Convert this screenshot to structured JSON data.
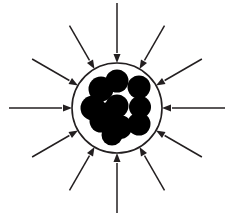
{
  "figure": {
    "title": "Inward radial compression of a particle cluster",
    "background_color": "#ffffff",
    "stroke_color": "#231f20",
    "fill_color": "#000000",
    "width": 227,
    "height": 214
  },
  "shell": {
    "name": "containment-circle",
    "center_x": 117,
    "center_y": 108,
    "radius": 45,
    "stroke_width": 1.6,
    "fill": "none",
    "stroke": "#231f20"
  },
  "particles": {
    "count": 11,
    "radius": 11.5,
    "fill": "#000000",
    "items": [
      {
        "name": "particle-top-center",
        "cx": 117,
        "cy": 81,
        "r": 11.5
      },
      {
        "name": "particle-top-right",
        "cx": 139,
        "cy": 87,
        "r": 11.5
      },
      {
        "name": "particle-upper-left",
        "cx": 101,
        "cy": 89,
        "r": 12.5
      },
      {
        "name": "particle-mid-left",
        "cx": 93,
        "cy": 108,
        "r": 12.5
      },
      {
        "name": "particle-mid-center",
        "cx": 117,
        "cy": 106,
        "r": 11.5
      },
      {
        "name": "particle-mid-right",
        "cx": 140,
        "cy": 107,
        "r": 11.0
      },
      {
        "name": "particle-lower-left",
        "cx": 101,
        "cy": 121,
        "r": 11.5
      },
      {
        "name": "particle-lower-center",
        "cx": 120,
        "cy": 127,
        "r": 12.0
      },
      {
        "name": "particle-lower-right",
        "cx": 139,
        "cy": 124,
        "r": 11.5
      },
      {
        "name": "particle-bottom-center",
        "cx": 112,
        "cy": 135,
        "r": 10.5
      },
      {
        "name": "particle-inner-fill",
        "cx": 108,
        "cy": 112,
        "r": 10.0
      }
    ]
  },
  "arrows": {
    "count": 12,
    "direction": "inward",
    "stroke_width": 1.5,
    "head_length": 9,
    "head_width": 7,
    "tip_radius": 45,
    "items": [
      {
        "name": "arrow-n",
        "angle_deg": 270,
        "tail_radius": 105,
        "label": "N"
      },
      {
        "name": "arrow-nne",
        "angle_deg": 300,
        "tail_radius": 95,
        "label": "NNE"
      },
      {
        "name": "arrow-ene",
        "angle_deg": 330,
        "tail_radius": 98,
        "label": "ENE"
      },
      {
        "name": "arrow-e",
        "angle_deg": 0,
        "tail_radius": 108,
        "label": "E"
      },
      {
        "name": "arrow-ese",
        "angle_deg": 30,
        "tail_radius": 98,
        "label": "ESE"
      },
      {
        "name": "arrow-sse",
        "angle_deg": 60,
        "tail_radius": 95,
        "label": "SSE"
      },
      {
        "name": "arrow-s",
        "angle_deg": 90,
        "tail_radius": 105,
        "label": "S"
      },
      {
        "name": "arrow-ssw",
        "angle_deg": 120,
        "tail_radius": 95,
        "label": "SSW"
      },
      {
        "name": "arrow-wsw",
        "angle_deg": 150,
        "tail_radius": 98,
        "label": "WSW"
      },
      {
        "name": "arrow-w",
        "angle_deg": 180,
        "tail_radius": 108,
        "label": "W"
      },
      {
        "name": "arrow-wnw",
        "angle_deg": 210,
        "tail_radius": 98,
        "label": "WNW"
      },
      {
        "name": "arrow-nnw",
        "angle_deg": 240,
        "tail_radius": 95,
        "label": "NNW"
      }
    ]
  }
}
